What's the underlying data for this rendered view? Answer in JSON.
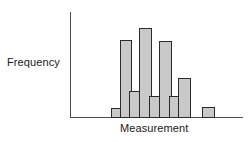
{
  "figure": {
    "kind": "histogram-figure",
    "background_color": "#ffffff"
  },
  "labels": {
    "y_axis": "Frequency",
    "x_axis": "Measurement"
  },
  "axes": {
    "line_color": "#4d4d4d",
    "y_axis_x": 70,
    "y_axis_top": 12,
    "y_axis_bottom": 118,
    "x_axis_y": 117,
    "x_axis_left": 70,
    "x_axis_right": 243,
    "ticks": [],
    "tick_labels": [],
    "grid": false
  },
  "style": {
    "bar_fill": "#c9c9c9",
    "bar_stroke": "#2b2b2b",
    "text_color": "#1a1a1a"
  },
  "chart_data": {
    "type": "bar",
    "title": "",
    "subtitle": "",
    "xlabel": "Measurement",
    "ylabel": "Frequency",
    "grid": false,
    "legend": null,
    "xlim": [
      0,
      9
    ],
    "ylim": [
      0,
      10
    ],
    "categories": [
      "1",
      "2",
      "3",
      "4",
      "5",
      "6",
      "7",
      "8",
      "9"
    ],
    "values": [
      1.5,
      7.3,
      2.6,
      9.0,
      2.1,
      7.2,
      2.1,
      4.0,
      1.5
    ],
    "bars": [
      {
        "category": "1",
        "value": 1.5,
        "x": 111,
        "width": 12,
        "top": 108,
        "height": 10
      },
      {
        "category": "2",
        "value": 7.3,
        "x": 120,
        "width": 12,
        "top": 40,
        "height": 78
      },
      {
        "category": "3",
        "value": 2.6,
        "x": 129,
        "width": 12,
        "top": 91,
        "height": 27
      },
      {
        "category": "4",
        "value": 9.0,
        "x": 139,
        "width": 13,
        "top": 28,
        "height": 90
      },
      {
        "category": "5",
        "value": 2.1,
        "x": 149,
        "width": 12,
        "top": 96,
        "height": 22
      },
      {
        "category": "6",
        "value": 7.2,
        "x": 159,
        "width": 13,
        "top": 41,
        "height": 77
      },
      {
        "category": "7",
        "value": 2.1,
        "x": 169,
        "width": 12,
        "top": 96,
        "height": 22
      },
      {
        "category": "8",
        "value": 4.0,
        "x": 178,
        "width": 13,
        "top": 78,
        "height": 40
      },
      {
        "category": "9",
        "value": 1.5,
        "x": 202,
        "width": 13,
        "top": 107,
        "height": 11
      }
    ]
  }
}
